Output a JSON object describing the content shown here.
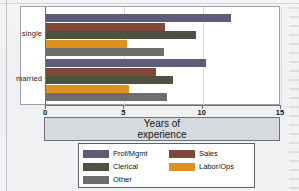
{
  "chart_data": {
    "type": "bar",
    "orientation": "horizontal",
    "title": "",
    "xlabel": "Years of experience",
    "ylabel": "",
    "categories": [
      "single",
      "married"
    ],
    "xlim": [
      0,
      15
    ],
    "xticks": [
      0,
      5,
      10,
      15
    ],
    "xticklabels": [
      "0",
      "5",
      "10",
      "15"
    ],
    "grid": true,
    "legend_position": "bottom",
    "series": [
      {
        "name": "Prof/Mgmt",
        "color": "#5d5d7a",
        "values": [
          11.8,
          10.2
        ]
      },
      {
        "name": "Sales",
        "color": "#7d4a3a",
        "values": [
          7.6,
          7.0
        ]
      },
      {
        "name": "Clerical",
        "color": "#4e5040",
        "values": [
          9.6,
          8.1
        ]
      },
      {
        "name": "Labor/Ops",
        "color": "#e09020",
        "values": [
          5.2,
          5.3
        ]
      },
      {
        "name": "Other",
        "color": "#6e6e6e",
        "values": [
          7.5,
          7.7
        ]
      }
    ]
  },
  "axis_title": {
    "line1": "Years of",
    "line2": "experience"
  },
  "legend": {
    "entries": [
      {
        "label": "Prof/Mgmt",
        "color": "#5d5d7a"
      },
      {
        "label": "Sales",
        "color": "#7d4a3a"
      },
      {
        "label": "Clerical",
        "color": "#4e5040"
      },
      {
        "label": "Labor/Ops",
        "color": "#e09020"
      },
      {
        "label": "Other",
        "color": "#6e6e6e"
      }
    ]
  }
}
